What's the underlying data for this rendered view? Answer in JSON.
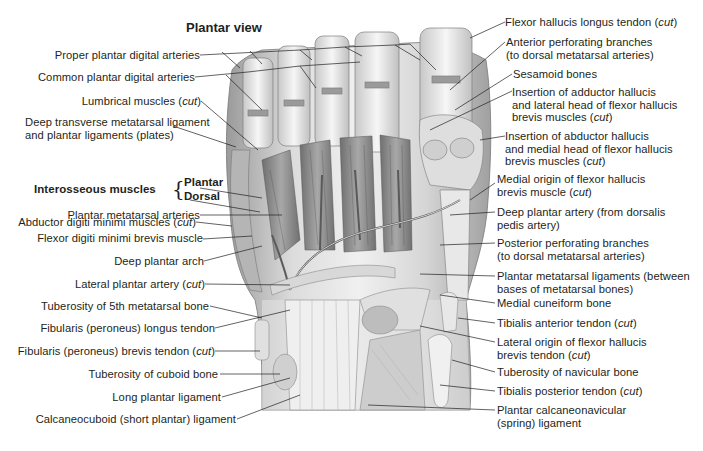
{
  "figure": {
    "title": "Plantar view",
    "left_labels": [
      {
        "id": "proper-plantar-digital-arteries",
        "text": "Proper plantar digital arteries",
        "suffix": ""
      },
      {
        "id": "common-plantar-digital-arteries",
        "text": "Common plantar digital arteries",
        "suffix": ""
      },
      {
        "id": "lumbrical-muscles",
        "text": "Lumbrical muscles (",
        "suffix": "cut",
        "close": ")"
      },
      {
        "id": "deep-transverse-metatarsal-ligament",
        "line1": "Deep transverse metatarsal ligament",
        "line2": "and plantar ligaments (plates)"
      },
      {
        "id": "interosseous-muscles",
        "text": "Interosseous muscles",
        "plantar": "Plantar",
        "dorsal": "Dorsal"
      },
      {
        "id": "abductor-digiti-minimi",
        "text": "Abductor digiti minimi muscles (",
        "suffix": "cut",
        "close": ")"
      },
      {
        "id": "plantar-metatarsal-arteries",
        "text": "Plantar metatarsal arteries"
      },
      {
        "id": "flexor-digiti-minimi-brevis",
        "text": "Flexor digiti minimi brevis muscle"
      },
      {
        "id": "deep-plantar-arch",
        "text": "Deep plantar arch"
      },
      {
        "id": "lateral-plantar-artery",
        "text": "Lateral plantar artery (",
        "suffix": "cut",
        "close": ")"
      },
      {
        "id": "tuberosity-5th-metatarsal",
        "text": "Tuberosity of 5th metatarsal bone"
      },
      {
        "id": "fibularis-longus",
        "text": "Fibularis (peroneus) longus tendon"
      },
      {
        "id": "fibularis-brevis",
        "text": "Fibularis (peroneus) brevis tendon (",
        "suffix": "cut",
        "close": ")"
      },
      {
        "id": "tuberosity-cuboid",
        "text": "Tuberosity of cuboid bone"
      },
      {
        "id": "long-plantar-ligament",
        "text": "Long plantar ligament"
      },
      {
        "id": "calcaneocuboid-ligament",
        "text": "Calcaneocuboid (short plantar) ligament"
      }
    ],
    "right_labels": [
      {
        "id": "flexor-hallucis-longus",
        "line1": "Flexor hallucis longus tendon (",
        "suffix": "cut",
        "close": ")"
      },
      {
        "id": "anterior-perforating",
        "line1": "Anterior perforating branches",
        "line2": "(to dorsal metatarsal arteries)"
      },
      {
        "id": "sesamoid-bones",
        "line1": "Sesamoid bones"
      },
      {
        "id": "insertion-adductor-hallucis",
        "line1": "Insertion of adductor hallucis",
        "line2": "and lateral head of flexor hallucis",
        "line3": "brevis muscles (",
        "suffix": "cut",
        "close": ")"
      },
      {
        "id": "insertion-abductor-hallucis",
        "line1": "Insertion of abductor hallucis",
        "line2": "and medial head of flexor hallucis",
        "line3": "brevis muscles (",
        "suffix": "cut",
        "close": ")"
      },
      {
        "id": "medial-origin-fhb",
        "line1": "Medial origin of flexor hallucis",
        "line2": "brevis muscle (",
        "suffix": "cut",
        "close": ")"
      },
      {
        "id": "deep-plantar-artery",
        "line1": "Deep plantar artery (from dorsalis",
        "line2": "pedis artery)"
      },
      {
        "id": "posterior-perforating",
        "line1": "Posterior perforating branches",
        "line2": "(to dorsal metatarsal arteries)"
      },
      {
        "id": "plantar-metatarsal-ligaments",
        "line1": "Plantar metatarsal ligaments (between",
        "line2": "bases of metatarsal bones)"
      },
      {
        "id": "medial-cuneiform",
        "line1": "Medial cuneiform bone"
      },
      {
        "id": "tibialis-anterior",
        "line1": "Tibialis anterior tendon (",
        "suffix": "cut",
        "close": ")"
      },
      {
        "id": "lateral-origin-fhb",
        "line1": "Lateral origin of flexor hallucis",
        "line2": "brevis tendon (",
        "suffix": "cut",
        "close": ")"
      },
      {
        "id": "tuberosity-navicular",
        "line1": "Tuberosity of navicular bone"
      },
      {
        "id": "tibialis-posterior",
        "line1": "Tibialis posterior tendon (",
        "suffix": "cut",
        "close": ")"
      },
      {
        "id": "spring-ligament",
        "line1": "Plantar calcaneonavicular",
        "line2": "(spring) ligament"
      }
    ],
    "colors": {
      "text": "#231f20",
      "line": "#231f20",
      "tissue_light": "#e6e6e6",
      "tissue_mid": "#bdbdbd",
      "tissue_dark": "#8a8a8a"
    }
  }
}
